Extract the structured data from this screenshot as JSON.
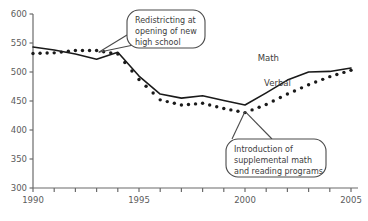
{
  "chart_data": {
    "type": "line",
    "title": "",
    "xlabel": "",
    "ylabel": "",
    "xlim": [
      1990,
      2005
    ],
    "ylim": [
      300,
      600
    ],
    "ytick_values": [
      300,
      350,
      400,
      450,
      500,
      550,
      600
    ],
    "ytick_labels": [
      "300",
      "350",
      "400",
      "450",
      "500",
      "550",
      "600"
    ],
    "xtick_values": [
      1990,
      1991,
      1992,
      1993,
      1994,
      1995,
      1996,
      1997,
      1998,
      1999,
      2000,
      2001,
      2002,
      2003,
      2004,
      2005
    ],
    "xtick_labels_shown": [
      "1990",
      "1995",
      "2000",
      "2005"
    ],
    "xtick_labels_shown_values": [
      1990,
      1995,
      2000,
      2005
    ],
    "grid": false,
    "legend": "inline-labels",
    "x": [
      1990,
      1991,
      1992,
      1993,
      1994,
      1995,
      1996,
      1997,
      1998,
      1999,
      2000,
      2001,
      2002,
      2003,
      2004,
      2005
    ],
    "series": [
      {
        "name": "Math",
        "style": "solid-line",
        "color": "#1a1a1a",
        "label_x": 2000.6,
        "label_y": 519,
        "values": [
          543,
          538,
          531,
          522,
          534,
          493,
          462,
          455,
          459,
          451,
          443,
          464,
          486,
          500,
          501,
          507
        ]
      },
      {
        "name": "Verbal",
        "style": "dotted-markers",
        "color": "#1a1a1a",
        "label_x": 2000.9,
        "label_y": 476,
        "values": [
          532,
          533,
          537,
          537,
          531,
          487,
          452,
          443,
          446,
          437,
          430,
          444,
          462,
          478,
          492,
          503
        ]
      }
    ],
    "annotations": [
      {
        "name": "redistricting-callout",
        "text_lines": [
          "Redistricting at",
          "opening of new",
          "high school"
        ],
        "anchor_x": 1993.1,
        "anchor_y": 534
      },
      {
        "name": "supplemental-programs-callout",
        "text_lines": [
          "Introduction of",
          "supplemental math",
          "and reading programs"
        ],
        "anchor_x": 2000.0,
        "anchor_y": 432
      }
    ],
    "axis_color": "#6b6b6b",
    "text_color": "#5b5b5b"
  }
}
